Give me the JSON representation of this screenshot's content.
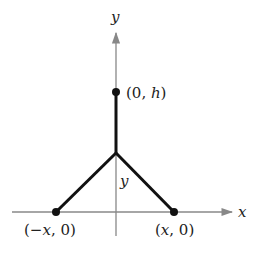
{
  "diagram": {
    "axes": {
      "x_label": "x",
      "y_label": "y",
      "axis_color": "#888888"
    },
    "points": [
      {
        "id": "top",
        "open": "(0, ",
        "var": "h",
        "close": ")"
      },
      {
        "id": "left",
        "open": "(−",
        "var": "x",
        "close": ", 0)"
      },
      {
        "id": "right",
        "open": "(",
        "var": "x",
        "close": ", 0)"
      }
    ],
    "segment_label": "y",
    "line_color": "#111111"
  }
}
